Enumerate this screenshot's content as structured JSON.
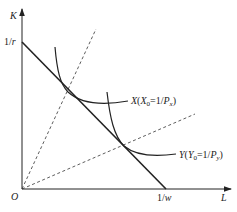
{
  "diagram": {
    "type": "isoquant-budget-diagram",
    "axes": {
      "y_label": "K",
      "x_label": "L",
      "origin_label": "O",
      "y_intercept_label": "1/r",
      "x_intercept_label": "1/w"
    },
    "curves": {
      "isoquant_x": {
        "label": "X(X₀=1/Pₓ)",
        "label_parts": {
          "name": "X",
          "open": "(",
          "var": "X",
          "sub": "0",
          "eq": "=1/",
          "price": "P",
          "price_sub": "x",
          "close": ")"
        }
      },
      "isoquant_y": {
        "label": "Y(Y₀=1/Pᵧ)",
        "label_parts": {
          "name": "Y",
          "open": "(",
          "var": "Y",
          "sub": "0",
          "eq": "=1/",
          "price": "P",
          "price_sub": "y",
          "close": ")"
        }
      },
      "budget_line": {
        "label": "isocost line"
      },
      "rays": [
        "steep ray (X factor intensity)",
        "shallow ray (Y factor intensity)"
      ]
    },
    "colors": {
      "line": "#222222",
      "background": "#ffffff"
    }
  }
}
